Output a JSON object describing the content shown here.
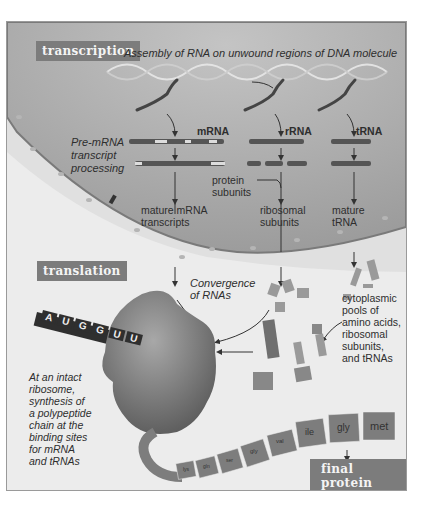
{
  "transcription": {
    "tag": "transcription",
    "caption": "Assembly of RNA on unwound regions of DNA molecule",
    "processing_label": [
      "Pre-mRNA",
      "transcript",
      "processing"
    ],
    "rna_types": [
      "mRNA",
      "rRNA",
      "tRNA"
    ],
    "protein_subunits": [
      "protein",
      "subunits"
    ],
    "mature_mrna": [
      "mature mRNA",
      "transcripts"
    ],
    "ribosomal_subunits": [
      "ribosomal",
      "subunits"
    ],
    "mature_trna": [
      "mature",
      "tRNA"
    ]
  },
  "translation": {
    "tag": "translation",
    "convergence": [
      "Convergence",
      "of RNAs"
    ],
    "cytoplasmic_pools": [
      "cytoplasmic",
      "pools of",
      "amino acids,",
      "ribosomal",
      "subunits,",
      "and tRNAs"
    ],
    "ribosome_caption": [
      "At an intact",
      "ribosome,",
      "synthesis of",
      "a polypeptide",
      "chain at the",
      "binding sites",
      "for mRNA",
      "and tRNAs"
    ],
    "mrna_codons": [
      "A",
      "U",
      "G",
      "G",
      "U",
      "U"
    ],
    "amino_acids": [
      "met",
      "gly",
      "ile",
      "val",
      "gly",
      "ser",
      "gln",
      "lys"
    ]
  },
  "final": {
    "tag": "final protein",
    "caption": "For use in cell or for export"
  },
  "colors": {
    "nucleus": "#a9a9a9",
    "cytoplasm": "#ececec",
    "tag": "#7c7c7c",
    "rna": "#555555"
  }
}
